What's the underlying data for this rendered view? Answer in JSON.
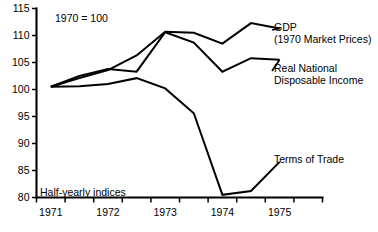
{
  "chart_data": {
    "type": "line",
    "title": "",
    "xlabel": "",
    "ylabel": "",
    "base_note": "1970 = 100",
    "frequency_note": "Half-yearly indices",
    "ylim": [
      80,
      115
    ],
    "yticks": [
      80,
      85,
      90,
      95,
      100,
      105,
      110,
      115
    ],
    "ytick_labels": [
      "80",
      "85",
      "90",
      "95",
      "100",
      "105",
      "110",
      "115"
    ],
    "xlim": [
      1970.75,
      1975.75
    ],
    "xtick_labels": [
      "1971",
      "1972",
      "1973",
      "1974",
      "1975"
    ],
    "xtick_values": [
      1971,
      1972,
      1973,
      1974,
      1975
    ],
    "x": [
      1971.0,
      1971.5,
      1972.0,
      1972.5,
      1973.0,
      1973.5,
      1974.0,
      1974.5,
      1975.0
    ],
    "grid": false,
    "legend_position": "right-inline-labels",
    "series": [
      {
        "name": "GDP (1970 Market Prices)",
        "label_line1": "GDP",
        "label_line2": "(1970 Market Prices)",
        "values": [
          100.5,
          102.1,
          103.6,
          106.3,
          110.7,
          110.5,
          108.5,
          112.3,
          111.3
        ]
      },
      {
        "name": "Real National Disposable Income",
        "label_line1": "Real National",
        "label_line2": "Disposable Income",
        "values": [
          100.5,
          102.5,
          103.8,
          103.3,
          110.6,
          108.7,
          103.3,
          105.8,
          105.5
        ]
      },
      {
        "name": "Terms of Trade",
        "label_line1": "Terms of Trade",
        "label_line2": "",
        "values": [
          100.5,
          100.6,
          101.0,
          102.1,
          100.2,
          95.6,
          80.5,
          81.2,
          86.6
        ]
      }
    ]
  }
}
